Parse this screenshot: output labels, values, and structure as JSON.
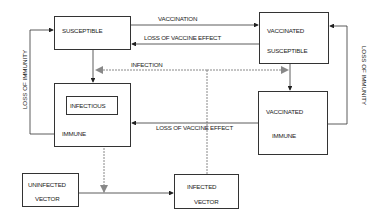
{
  "diagram": {
    "nodes": {
      "susceptible": {
        "label": "SUSCEPTIBLE"
      },
      "vaccinated_susceptible": {
        "line1": "VACCINATED",
        "line2": "SUSCEPTIBLE"
      },
      "immune": {
        "label": "IMMUNE"
      },
      "infectious": {
        "label": "INFECTIOUS"
      },
      "vaccinated_immune": {
        "line1": "VACCINATED",
        "line2": "IMMUNE"
      },
      "uninfected_vector": {
        "line1": "UNINFECTED",
        "line2": "VECTOR"
      },
      "infected_vector": {
        "line1": "INFECTED",
        "line2": "VECTOR"
      }
    },
    "edges": {
      "vaccination": "VACCINATION",
      "loss_vaccine_effect_top": "LOSS OF VACCINE EFFECT",
      "infection": "INFECTION",
      "loss_vaccine_effect_bottom": "LOSS OF VACCINE EFFECT",
      "loss_immunity_left": "LOSS OF IMMUNITY",
      "loss_immunity_right": "LOSS OF IMMUNITY"
    },
    "colors": {
      "line": "#333333",
      "dashed": "#888888"
    }
  }
}
